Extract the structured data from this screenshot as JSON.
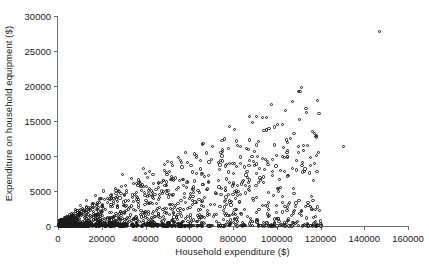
{
  "chart_data": {
    "type": "scatter",
    "title": "",
    "xlabel": "Household expenditure ($)",
    "ylabel": "Expenditure on household equipment ($)",
    "xlim": [
      0,
      160000
    ],
    "ylim": [
      0,
      30000
    ],
    "xticks": [
      0,
      20000,
      40000,
      60000,
      80000,
      100000,
      120000,
      140000,
      160000
    ],
    "yticks": [
      0,
      5000,
      10000,
      15000,
      20000,
      25000,
      30000
    ],
    "xtick_labels": [
      "0",
      "20000",
      "40000",
      "60000",
      "80000",
      "100000",
      "120000",
      "140000",
      "160000"
    ],
    "ytick_labels": [
      "0",
      "5000",
      "10000",
      "15000",
      "20000",
      "25000",
      "30000"
    ],
    "grid": false,
    "legend": null,
    "marker": "open-circle",
    "marker_color": "#1b1b1b",
    "frame_color": "#6e6e6e",
    "background": "#ffffff",
    "points": [
      [
        146800,
        27800
      ],
      [
        130500,
        11300
      ],
      [
        107200,
        8200
      ],
      [
        93500,
        9600
      ],
      [
        93800,
        7000
      ],
      [
        116000,
        4200
      ],
      [
        107600,
        5400
      ],
      [
        107900,
        4600
      ],
      [
        100300,
        5300
      ],
      [
        98500,
        4400
      ],
      [
        85700,
        5800
      ],
      [
        82200,
        4300
      ],
      [
        108700,
        2800
      ],
      [
        91900,
        2400
      ],
      [
        106700,
        1500
      ],
      [
        81000,
        3900
      ],
      [
        78600,
        3400
      ],
      [
        75800,
        2200
      ],
      [
        72400,
        4600
      ],
      [
        70200,
        9500
      ],
      [
        68900,
        6200
      ],
      [
        66100,
        5900
      ],
      [
        64800,
        4800
      ],
      [
        63200,
        3300
      ],
      [
        61700,
        5200
      ],
      [
        60300,
        2700
      ],
      [
        59100,
        6400
      ],
      [
        57800,
        4100
      ],
      [
        56200,
        3600
      ],
      [
        55000,
        5500
      ],
      [
        53700,
        2900
      ],
      [
        52400,
        4400
      ],
      [
        51100,
        3100
      ],
      [
        49800,
        7400
      ],
      [
        48600,
        2500
      ],
      [
        47300,
        5000
      ],
      [
        46100,
        3800
      ],
      [
        44900,
        2200
      ],
      [
        43600,
        6100
      ],
      [
        42400,
        3400
      ],
      [
        41200,
        4700
      ],
      [
        40100,
        2000
      ],
      [
        39000,
        8200
      ],
      [
        37900,
        5600
      ],
      [
        36800,
        3000
      ],
      [
        35700,
        4200
      ],
      [
        34600,
        2400
      ],
      [
        33500,
        6800
      ],
      [
        32400,
        3700
      ],
      [
        31300,
        5100
      ],
      [
        30300,
        2100
      ],
      [
        29300,
        7300
      ],
      [
        28300,
        4000
      ],
      [
        27300,
        2600
      ],
      [
        26300,
        5400
      ],
      [
        25300,
        3200
      ],
      [
        24400,
        4500
      ],
      [
        23400,
        1900
      ],
      [
        22500,
        3900
      ],
      [
        21600,
        2300
      ],
      [
        20700,
        5000
      ],
      [
        19800,
        2800
      ],
      [
        18900,
        3400
      ],
      [
        18000,
        1700
      ],
      [
        17200,
        4300
      ],
      [
        16400,
        2100
      ],
      [
        15600,
        3000
      ],
      [
        14800,
        1500
      ],
      [
        14000,
        2600
      ],
      [
        13200,
        3600
      ],
      [
        12500,
        1300
      ],
      [
        11800,
        2200
      ],
      [
        11100,
        1800
      ],
      [
        10400,
        2900
      ],
      [
        9700,
        1100
      ],
      [
        9100,
        1900
      ],
      [
        8500,
        1400
      ],
      [
        7900,
        2300
      ],
      [
        7300,
        900
      ],
      [
        6700,
        1600
      ],
      [
        6200,
        1200
      ],
      [
        5700,
        800
      ],
      [
        5200,
        1400
      ],
      [
        4700,
        600
      ],
      [
        4200,
        1000
      ],
      [
        3800,
        500
      ],
      [
        3400,
        800
      ],
      [
        3000,
        400
      ],
      [
        2600,
        600
      ],
      [
        2200,
        300
      ],
      [
        1900,
        500
      ],
      [
        1600,
        250
      ],
      [
        1300,
        400
      ],
      [
        1000,
        200
      ],
      [
        800,
        300
      ],
      [
        600,
        150
      ],
      [
        450,
        200
      ],
      [
        300,
        100
      ],
      [
        200,
        150
      ],
      [
        120,
        80
      ]
    ]
  }
}
